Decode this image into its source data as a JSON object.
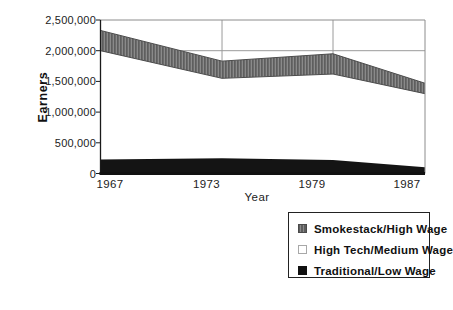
{
  "figure": {
    "y_axis_title": "Earners",
    "x_axis_title": "Year",
    "y_tick_labels": [
      "2,500,000",
      "2,000,000",
      "1,500,000",
      "1,000,000",
      "500,000",
      "0"
    ],
    "x_tick_labels": [
      "1967",
      "1973",
      "1979",
      "1987"
    ],
    "legend": [
      {
        "label": "Smokestack/High Wage",
        "swatch_icon": "gray-striped-square-icon"
      },
      {
        "label": "High Tech/Medium Wage",
        "swatch_icon": "white-square-icon"
      },
      {
        "label": "Traditional/Low Wage",
        "swatch_icon": "black-square-icon"
      }
    ],
    "colors": {
      "smokestack_gray": "#6e6e6e",
      "high_tech_white": "#ffffff",
      "traditional_black": "#141414",
      "gridline": "#9a9a9a",
      "axis": "#1a1a1a"
    }
  },
  "chart_data": {
    "type": "area",
    "stacked": true,
    "title": "",
    "xlabel": "Year",
    "ylabel": "Earners",
    "x": [
      1967,
      1973,
      1979,
      1987
    ],
    "series": [
      {
        "name": "Traditional/Low Wage",
        "color": "#141414",
        "values": [
          230000,
          250000,
          220000,
          100000
        ]
      },
      {
        "name": "High Tech/Medium Wage",
        "color": "#ffffff",
        "values": [
          1770000,
          1300000,
          1400000,
          1200000
        ]
      },
      {
        "name": "Smokestack/High Wage",
        "color": "#6e6e6e",
        "values": [
          330000,
          280000,
          330000,
          170000
        ]
      }
    ],
    "stack_totals": [
      2330000,
      1830000,
      1950000,
      1470000
    ],
    "ylim": [
      0,
      2500000
    ],
    "y_tick_step": 500000,
    "gridlines": {
      "vertical_at_x": [
        1973,
        1979
      ],
      "horizontal_at_y": [
        2000000
      ]
    },
    "legend_position": "below-right"
  }
}
